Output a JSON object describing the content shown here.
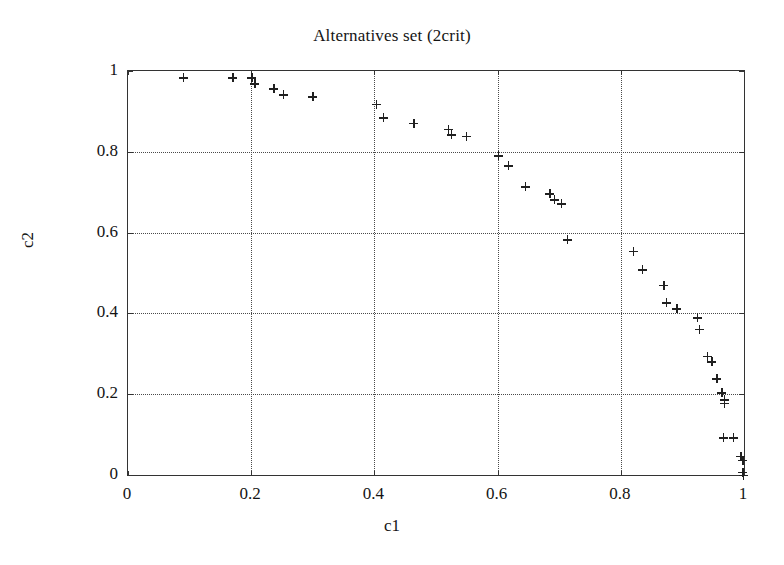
{
  "chart_data": {
    "type": "scatter",
    "title": "Alternatives set (2crit)",
    "xlabel": "c1",
    "ylabel": "c2",
    "xlim": [
      0,
      1
    ],
    "ylim": [
      0,
      1
    ],
    "xticks": [
      "0",
      "0.2",
      "0.4",
      "0.6",
      "0.8",
      "1"
    ],
    "xtick_values": [
      0,
      0.2,
      0.4,
      0.6,
      0.8,
      1
    ],
    "yticks": [
      "0",
      "0.2",
      "0.4",
      "0.6",
      "0.8",
      "1"
    ],
    "ytick_values": [
      0,
      0.2,
      0.4,
      0.6,
      0.8,
      1
    ],
    "grid": true,
    "legend": null,
    "marker": "plus",
    "marker_color": "#202020",
    "series": [
      {
        "name": "alternatives",
        "points": [
          [
            0.09,
            0.983
          ],
          [
            0.17,
            0.983
          ],
          [
            0.201,
            0.983
          ],
          [
            0.206,
            0.968
          ],
          [
            0.237,
            0.956
          ],
          [
            0.252,
            0.941
          ],
          [
            0.3,
            0.936
          ],
          [
            0.403,
            0.918
          ],
          [
            0.414,
            0.884
          ],
          [
            0.464,
            0.871
          ],
          [
            0.52,
            0.856
          ],
          [
            0.525,
            0.842
          ],
          [
            0.549,
            0.839
          ],
          [
            0.601,
            0.79
          ],
          [
            0.617,
            0.765
          ],
          [
            0.645,
            0.713
          ],
          [
            0.685,
            0.696
          ],
          [
            0.692,
            0.681
          ],
          [
            0.703,
            0.671
          ],
          [
            0.713,
            0.582
          ],
          [
            0.82,
            0.554
          ],
          [
            0.835,
            0.508
          ],
          [
            0.87,
            0.47
          ],
          [
            0.874,
            0.426
          ],
          [
            0.891,
            0.411
          ],
          [
            0.924,
            0.389
          ],
          [
            0.927,
            0.361
          ],
          [
            0.94,
            0.294
          ],
          [
            0.948,
            0.28
          ],
          [
            0.956,
            0.238
          ],
          [
            0.964,
            0.203
          ],
          [
            0.968,
            0.186
          ],
          [
            0.968,
            0.178
          ],
          [
            0.966,
            0.092
          ],
          [
            0.983,
            0.092
          ],
          [
            0.995,
            0.047
          ],
          [
            0.998,
            0.037
          ],
          [
            0.998,
            0.007
          ],
          [
            0.999,
            0.0
          ]
        ]
      }
    ]
  }
}
